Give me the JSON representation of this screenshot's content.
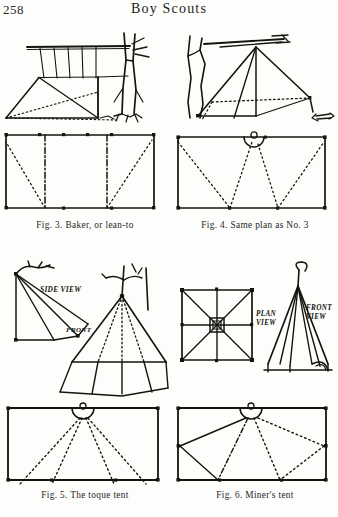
{
  "page": {
    "folio": "258",
    "book_title": "Boy Scouts",
    "background_color": "#fdfdfb",
    "ink_color": "#15140f"
  },
  "figures": [
    {
      "id": "fig3",
      "caption": "Fig. 3.   Baker, or lean-to",
      "sketch_label": "lean-to tent pitched against a tree",
      "plan_label": "floor plan rectangle with dashed guy lines",
      "inline_labels": []
    },
    {
      "id": "fig4",
      "caption": "Fig. 4.   Same plan as No. 3",
      "sketch_label": "wedge tent with ridge pole lashed to tree",
      "plan_label": "floor plan rectangle with dotted guy lines and door circle",
      "inline_labels": []
    },
    {
      "id": "fig5",
      "caption": "Fig. 5.   The toque tent",
      "sketch_label": "toque tent side view and perspective view",
      "plan_label": "floor plan rectangle with semicircular door and fan guy lines",
      "inline_labels": [
        "SIDE VIEW",
        "FRONT"
      ]
    },
    {
      "id": "fig6",
      "caption": "Fig. 6.   Miner's tent",
      "sketch_label": "miner's tent plan view square and front elevation",
      "plan_label": "floor plan rectangle with semicircular door and fan guy lines",
      "inline_labels": [
        "PLAN VIEW",
        "FRONT VIEW"
      ]
    }
  ]
}
